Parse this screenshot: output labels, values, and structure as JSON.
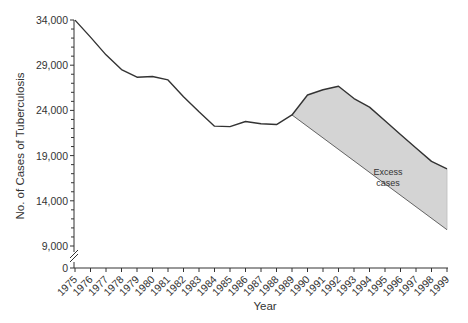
{
  "chart_data": {
    "type": "area",
    "title": "",
    "xlabel": "Year",
    "ylabel": "No. of Cases of Tuberculosis",
    "y_ticks": [
      "34,000",
      "29,000",
      "24,000",
      "19,000",
      "14,000",
      "9,000",
      "0"
    ],
    "y_tick_values": [
      34000,
      29000,
      24000,
      19000,
      14000,
      9000,
      0
    ],
    "axis_break": true,
    "ylim": [
      0,
      34000
    ],
    "x": [
      1975,
      1976,
      1977,
      1978,
      1979,
      1980,
      1981,
      1982,
      1983,
      1984,
      1985,
      1986,
      1987,
      1988,
      1989,
      1990,
      1991,
      1992,
      1993,
      1994,
      1995,
      1996,
      1997,
      1998,
      1999
    ],
    "x_tick_labels": [
      "1975",
      "1976",
      "1977",
      "1978",
      "1979",
      "1980",
      "1981",
      "1982",
      "1983",
      "1984",
      "1985",
      "1986",
      "1987",
      "1988",
      "1989",
      "1990",
      "1991",
      "1992",
      "1993",
      "1994",
      "1995",
      "1996",
      "1997",
      "1998",
      "1999"
    ],
    "grid": false,
    "series": [
      {
        "name": "Reported cases",
        "values": [
          33989,
          32105,
          30145,
          28521,
          27669,
          27749,
          27373,
          25520,
          23846,
          22255,
          22201,
          22768,
          22517,
          22436,
          23495,
          25701,
          26283,
          26673,
          25313,
          24361,
          22860,
          21337,
          19851,
          18361,
          17531
        ]
      },
      {
        "name": "Expected trend (projected decline)",
        "x": [
          1989,
          1999
        ],
        "values": [
          23495,
          10800
        ]
      }
    ],
    "shaded_region": {
      "label": "Excess cases",
      "between": [
        "Reported cases",
        "Expected trend (projected decline)"
      ],
      "x_range": [
        1989,
        1999
      ],
      "fill": "#d4d4d4"
    },
    "legend": null,
    "annotations": [
      {
        "text_line1": "Excess",
        "text_line2": "cases",
        "x": 1995,
        "y": 20500
      }
    ]
  },
  "colors": {
    "line": "#333333",
    "fill": "#d4d4d4",
    "axis": "#333333"
  }
}
